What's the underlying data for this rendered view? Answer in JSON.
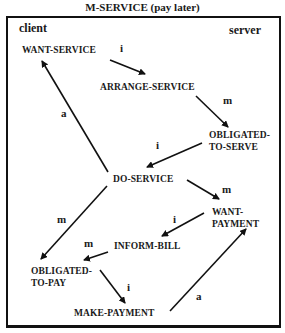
{
  "title": "M-SERVICE (pay later)",
  "roles": {
    "client": "client",
    "server": "server"
  },
  "nodes": {
    "want_service": "WANT-SERVICE",
    "arrange_service": "ARRANGE-SERVICE",
    "obligated_to_serve_1": "OBLIGATED-",
    "obligated_to_serve_2": "TO-SERVE",
    "do_service": "DO-SERVICE",
    "want_payment_1": "WANT-",
    "want_payment_2": "PAYMENT",
    "inform_bill": "INFORM-BILL",
    "obligated_to_pay_1": "OBLIGATED-",
    "obligated_to_pay_2": "TO-PAY",
    "make_payment": "MAKE-PAYMENT"
  },
  "edges": [
    {
      "from": "WANT-SERVICE",
      "to": "ARRANGE-SERVICE",
      "label": "i"
    },
    {
      "from": "ARRANGE-SERVICE",
      "to": "OBLIGATED-TO-SERVE",
      "label": "m"
    },
    {
      "from": "OBLIGATED-TO-SERVE",
      "to": "DO-SERVICE",
      "label": "i"
    },
    {
      "from": "DO-SERVICE",
      "to": "WANT-SERVICE",
      "label": "a"
    },
    {
      "from": "DO-SERVICE",
      "to": "WANT-PAYMENT",
      "label": "m"
    },
    {
      "from": "DO-SERVICE",
      "to": "OBLIGATED-TO-PAY",
      "label": "m"
    },
    {
      "from": "WANT-PAYMENT",
      "to": "INFORM-BILL",
      "label": "i"
    },
    {
      "from": "INFORM-BILL",
      "to": "OBLIGATED-TO-PAY",
      "label": "m"
    },
    {
      "from": "OBLIGATED-TO-PAY",
      "to": "MAKE-PAYMENT",
      "label": "i"
    },
    {
      "from": "MAKE-PAYMENT",
      "to": "WANT-PAYMENT",
      "label": "a"
    }
  ],
  "colors": {
    "ink": "#111111",
    "background": "#ffffff"
  }
}
